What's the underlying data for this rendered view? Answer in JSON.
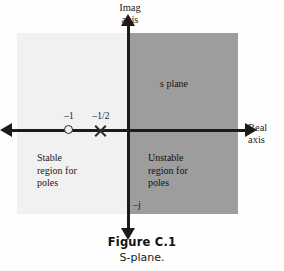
{
  "figure": {
    "caption_title": "Figure C.1",
    "caption_subtitle": "S-plane."
  },
  "chart_data": {
    "type": "scatter",
    "title": "S-plane.",
    "subtitle": "Figure C.1",
    "xlabel": "Real axis",
    "ylabel": "Imag axis",
    "axis_labels": {
      "imag": "Imag\naxis",
      "imag_line1": "Imag",
      "imag_line2": "axis",
      "real": "Real\naxis",
      "real_line1": "Real",
      "real_line2": "axis",
      "negative_imag_tick": "–j"
    },
    "plane_label": "s plane",
    "regions": [
      {
        "name": "stable-region",
        "label": "Stable\nregion for\npoles",
        "line1": "Stable",
        "line2": "region for",
        "line3": "poles",
        "half_plane": "left",
        "fill": "#f1f1f1"
      },
      {
        "name": "unstable-region",
        "label": "Unstable\nregion for\npoles",
        "line1": "Unstable",
        "line2": "region for",
        "line3": "poles",
        "half_plane": "right",
        "fill": "#9d9d9d"
      }
    ],
    "markers": [
      {
        "name": "zero",
        "glyph": "circle-marker",
        "label": "–1",
        "x": -1,
        "y": 0
      },
      {
        "name": "pole",
        "glyph": "x-marker",
        "label": "–1/2",
        "x": -0.5,
        "y": 0
      }
    ],
    "grid": false,
    "legend": null,
    "xlim": [
      -2,
      2
    ],
    "ylim": [
      -1.6,
      1.6
    ]
  },
  "colors": {
    "axis": "#1b1b1b",
    "stable_fill": "#f1f1f1",
    "unstable_fill": "#9d9d9d",
    "background": "#fefefe",
    "text": "#1b1b1b"
  }
}
